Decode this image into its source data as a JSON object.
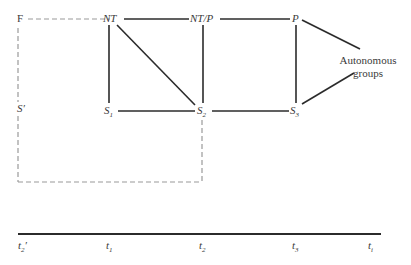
{
  "diagram": {
    "nodes": {
      "F": {
        "label": "F"
      },
      "NT": {
        "label": "NT"
      },
      "NTP": {
        "label": "NT/P"
      },
      "P": {
        "label": "P"
      },
      "S_prime": {
        "label": "S",
        "mark": "′"
      },
      "S1": {
        "label": "S",
        "sub": "1"
      },
      "S2": {
        "label": "S",
        "sub": "2"
      },
      "S3": {
        "label": "S",
        "sub": "3"
      },
      "autonomous": {
        "line1": "Autonomous",
        "line2": "groups"
      }
    },
    "edges": [
      [
        "NT",
        "NT/P"
      ],
      [
        "NT/P",
        "P"
      ],
      [
        "NT",
        "S1"
      ],
      [
        "NT",
        "S2"
      ],
      [
        "NT/P",
        "S2"
      ],
      [
        "P",
        "S3"
      ],
      [
        "S1",
        "S2"
      ],
      [
        "S2",
        "S3"
      ],
      [
        "P",
        "Autonomous groups"
      ],
      [
        "S3",
        "Autonomous groups"
      ]
    ],
    "dashed_region": [
      "F",
      "NT",
      "S'",
      "S2"
    ],
    "colors": {
      "solid_line": "#2b2b2b",
      "dashed_line": "#9a9a9a",
      "text": "#3a3a3a"
    }
  },
  "timeline": {
    "ticks": [
      {
        "base": "t",
        "sub": "2",
        "mark": "′"
      },
      {
        "base": "t",
        "sub": "1",
        "mark": ""
      },
      {
        "base": "t",
        "sub": "2",
        "mark": ""
      },
      {
        "base": "t",
        "sub": "3",
        "mark": ""
      },
      {
        "base": "t",
        "sub": "i",
        "mark": ""
      }
    ]
  }
}
